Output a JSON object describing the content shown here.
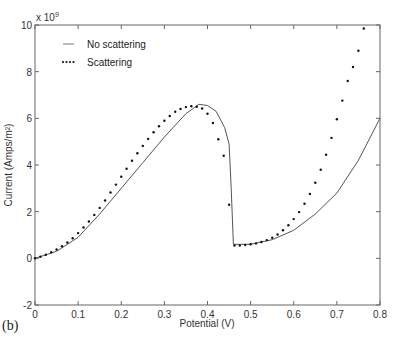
{
  "chart_data": {
    "type": "line",
    "title": "",
    "xlabel": "Potential (V)",
    "ylabel": "Current (Amps/m²)",
    "y_multiplier": "x 10^9",
    "xlim": [
      0,
      0.8
    ],
    "ylim": [
      -2,
      10
    ],
    "x_ticks": [
      "0",
      "0.1",
      "0.2",
      "0.3",
      "0.4",
      "0.5",
      "0.6",
      "0.7",
      "0.8"
    ],
    "y_ticks": [
      "-2",
      "0",
      "2",
      "4",
      "6",
      "8",
      "10"
    ],
    "grid": false,
    "legend_position": "upper left",
    "series": [
      {
        "name": "No scattering",
        "style": "solid",
        "x": [
          0,
          0.05,
          0.1,
          0.15,
          0.2,
          0.25,
          0.3,
          0.35,
          0.38,
          0.4,
          0.42,
          0.44,
          0.45,
          0.455,
          0.46,
          0.5,
          0.55,
          0.6,
          0.65,
          0.7,
          0.75,
          0.8
        ],
        "y": [
          0,
          0.3,
          0.9,
          1.9,
          3.0,
          4.1,
          5.2,
          6.2,
          6.6,
          6.55,
          6.3,
          5.6,
          4.9,
          3.0,
          0.6,
          0.6,
          0.8,
          1.2,
          1.9,
          2.8,
          4.2,
          6.0
        ]
      },
      {
        "name": "Scattering",
        "style": "dotted",
        "x": [
          0,
          0.0125,
          0.025,
          0.0375,
          0.05,
          0.0625,
          0.075,
          0.0875,
          0.1,
          0.1125,
          0.125,
          0.1375,
          0.15,
          0.1625,
          0.175,
          0.1875,
          0.2,
          0.2125,
          0.225,
          0.2375,
          0.25,
          0.2625,
          0.275,
          0.2875,
          0.3,
          0.3125,
          0.325,
          0.3375,
          0.35,
          0.3625,
          0.375,
          0.3875,
          0.4,
          0.4125,
          0.425,
          0.4375,
          0.45,
          0.4625,
          0.475,
          0.4875,
          0.5,
          0.5125,
          0.525,
          0.5375,
          0.55,
          0.5625,
          0.575,
          0.5875,
          0.6,
          0.6125,
          0.625,
          0.6375,
          0.65,
          0.6625,
          0.675,
          0.6875,
          0.7,
          0.7125,
          0.725,
          0.7375,
          0.75,
          0.7625
        ],
        "y": [
          0,
          0.07,
          0.15,
          0.26,
          0.38,
          0.52,
          0.68,
          0.86,
          1.08,
          1.32,
          1.58,
          1.86,
          2.16,
          2.48,
          2.82,
          3.16,
          3.5,
          3.84,
          4.18,
          4.5,
          4.82,
          5.12,
          5.4,
          5.66,
          5.9,
          6.1,
          6.28,
          6.4,
          6.48,
          6.52,
          6.5,
          6.42,
          6.2,
          5.8,
          5.1,
          4.4,
          2.3,
          0.55,
          0.55,
          0.57,
          0.6,
          0.64,
          0.7,
          0.78,
          0.88,
          1.02,
          1.2,
          1.42,
          1.68,
          1.98,
          2.34,
          2.76,
          3.24,
          3.8,
          4.44,
          5.16,
          5.96,
          6.76,
          7.6,
          8.2,
          8.9,
          9.85
        ]
      }
    ]
  },
  "legend": {
    "items": [
      {
        "label": "No scattering",
        "style": "solid"
      },
      {
        "label": "Scattering",
        "style": "dotted"
      }
    ]
  },
  "axes": {
    "xlabel": "Potential (V)",
    "ylabel": "Current (Amps/m²)",
    "multiplier_base": "x 10",
    "multiplier_exp": "9"
  },
  "panel_label": "(b)",
  "colors": {
    "axis": "#555555",
    "solid_line": "#555555",
    "dots": "#111111"
  }
}
